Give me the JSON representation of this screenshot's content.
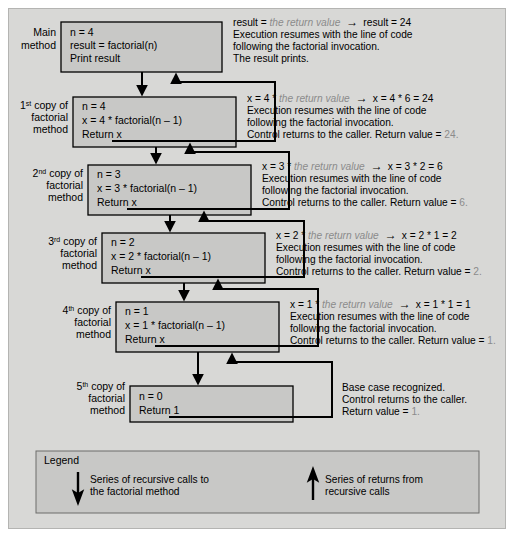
{
  "diagram": {
    "colors": {
      "page_background": "#ffffff",
      "frame_background": "#d8d8d6",
      "box_fill": "#c8c8c6",
      "box_stroke": "#000000",
      "frame_stroke": "#b4b4b2",
      "dim_text": "#8b8b8b",
      "text": "#000000"
    },
    "frames": [
      {
        "id": "main",
        "label_lines": [
          "Main",
          "method"
        ],
        "box_lines": [
          "n = 4",
          "result = factorial(n)",
          "Print result"
        ],
        "note": {
          "line1_pre": "result = ",
          "line1_italic": "the return value",
          "line1_arrow": "→",
          "line1_post": "result = 24",
          "line2": "Execution resumes with the line of code",
          "line3": "following the factorial invocation.",
          "line4": "The result prints.",
          "line4_dim": ""
        }
      },
      {
        "id": "copy1",
        "label_lines": [
          "1st copy of",
          "factorial",
          "method"
        ],
        "label_ordinal": "1",
        "label_ordinal_sup": "st",
        "box_lines": [
          "n = 4",
          "x = 4 * factorial(n – 1)",
          "Return x"
        ],
        "note": {
          "line1_pre": "x = 4 * ",
          "line1_italic": "the return value",
          "line1_arrow": "→",
          "line1_post": "x = 4 * 6 = 24",
          "line2": "Execution resumes with the line of code",
          "line3": "following the factorial invocation.",
          "line4": "Control returns to the caller. Return value = ",
          "line4_dim": "24."
        }
      },
      {
        "id": "copy2",
        "label_lines": [
          "2nd copy of",
          "factorial",
          "method"
        ],
        "label_ordinal": "2",
        "label_ordinal_sup": "nd",
        "box_lines": [
          "n = 3",
          "x = 3 * factorial(n – 1)",
          "Return x"
        ],
        "note": {
          "line1_pre": "x = 3 * ",
          "line1_italic": "the return value",
          "line1_arrow": "→",
          "line1_post": "x = 3 * 2 = 6",
          "line2": "Execution resumes with the line of code",
          "line3": "following the factorial invocation.",
          "line4": "Control returns to the caller. Return value = ",
          "line4_dim": "6."
        }
      },
      {
        "id": "copy3",
        "label_lines": [
          "3rd copy of",
          "factorial",
          "method"
        ],
        "label_ordinal": "3",
        "label_ordinal_sup": "rd",
        "box_lines": [
          "n = 2",
          "x = 2 * factorial(n – 1)",
          "Return x"
        ],
        "note": {
          "line1_pre": "x = 2 * ",
          "line1_italic": "the return value",
          "line1_arrow": "→",
          "line1_post": "x = 2 * 1 = 2",
          "line2": "Execution resumes with the line of code",
          "line3": "following the factorial invocation.",
          "line4": "Control returns to the caller. Return value = ",
          "line4_dim": "2."
        }
      },
      {
        "id": "copy4",
        "label_lines": [
          "4th copy of",
          "factorial",
          "method"
        ],
        "label_ordinal": "4",
        "label_ordinal_sup": "th",
        "box_lines": [
          "n = 1",
          "x = 1 * factorial(n – 1)",
          "Return x"
        ],
        "note": {
          "line1_pre": "x = 1 * ",
          "line1_italic": "the return value",
          "line1_arrow": "→",
          "line1_post": "x = 1 * 1 = 1",
          "line2": "Execution resumes with the line of code",
          "line3": "following the factorial invocation.",
          "line4": "Control returns to the caller. Return value = ",
          "line4_dim": "1."
        }
      },
      {
        "id": "copy5",
        "label_lines": [
          "5th copy of",
          "factorial",
          "method"
        ],
        "label_ordinal": "5",
        "label_ordinal_sup": "th",
        "box_lines": [
          "n = 0",
          "Return 1"
        ],
        "note": {
          "line1_pre": "Base case recognized.",
          "line1_italic": "",
          "line1_arrow": "",
          "line1_post": "",
          "line2": "Control returns to the caller.",
          "line3": "Return value = ",
          "line3_dim": "1.",
          "line4": "",
          "line4_dim": ""
        }
      }
    ],
    "legend": {
      "title": "Legend",
      "down_arrow_text_line1": "Series of recursive calls to",
      "down_arrow_text_line2": "the factorial method",
      "up_arrow_text_line1": "Series of returns from",
      "up_arrow_text_line2": "recursive calls",
      "down_icon": "arrow-down-icon",
      "up_icon": "arrow-up-icon"
    }
  }
}
